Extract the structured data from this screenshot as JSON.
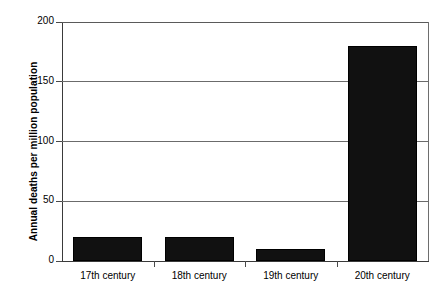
{
  "chart_data": {
    "type": "bar",
    "title": "",
    "xlabel": "",
    "ylabel": "Annual deaths per million population",
    "categories": [
      "17th century",
      "18th century",
      "19th century",
      "20th century"
    ],
    "values": [
      20,
      20,
      10,
      180
    ],
    "ylim": [
      0,
      200
    ],
    "yticks": [
      0,
      50,
      100,
      150,
      200
    ],
    "ytick_labels": [
      "0",
      "50",
      "100",
      "150",
      "200"
    ],
    "grid": true,
    "legend": false,
    "bar_color": "#111111",
    "gridline_color": "#6b6b6b",
    "axis_color": "#3a3a3a",
    "background": "#ffffff"
  }
}
